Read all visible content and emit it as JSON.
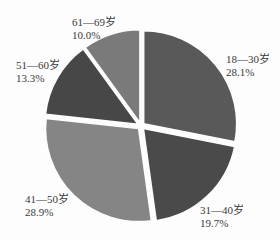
{
  "chart_data": {
    "type": "pie",
    "title": "",
    "start_angle_deg": 0,
    "direction": "clockwise",
    "exploded": true,
    "categories": [
      "18—30岁",
      "31—40岁",
      "41—50岁",
      "51—60岁",
      "61—69岁"
    ],
    "values": [
      28.1,
      19.7,
      28.9,
      13.3,
      10.0
    ],
    "value_labels": [
      "28.1%",
      "19.7%",
      "28.9%",
      "13.3%",
      "10.0%"
    ],
    "colors": [
      "#595959",
      "#4a4a4a",
      "#858585",
      "#474747",
      "#7a7a7a"
    ],
    "legend": "none"
  },
  "labels": [
    {
      "name": "18—30岁",
      "pct": "28.1%"
    },
    {
      "name": "31—40岁",
      "pct": "19.7%"
    },
    {
      "name": "41—50岁",
      "pct": "28.9%"
    },
    {
      "name": "51—60岁",
      "pct": "13.3%"
    },
    {
      "name": "61—69岁",
      "pct": "10.0%"
    }
  ]
}
